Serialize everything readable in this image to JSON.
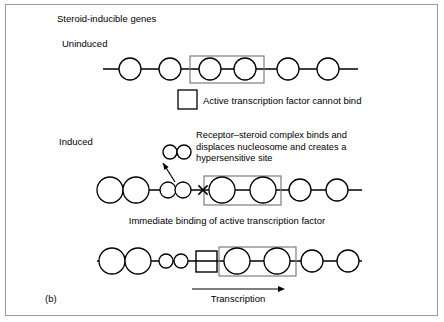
{
  "figure": {
    "label": "(b)",
    "title": "Steroid-inducible genes",
    "frame_color": "#9a9a9a",
    "ink_color": "#000000",
    "background_color": "#ffffff"
  },
  "panels": [
    {
      "id": "uninduced",
      "state_label": "Uninduced",
      "caption": "Active transcription factor cannot bind",
      "caption_has_box_swatch": true
    },
    {
      "id": "induced",
      "state_label": "Induced",
      "annotation_lines": [
        "Receptor–steroid complex binds and",
        "displaces nucleosome and creates a",
        "hypersensitive site"
      ],
      "hypersensitive_marker": "×"
    },
    {
      "id": "bound",
      "caption": "Immediate binding of active transcription factor",
      "arrow_label": "Transcription"
    }
  ],
  "legend": {
    "square_meaning": "Active transcription factor",
    "circle_meaning": "Nucleosome",
    "small_circle_meaning": "Receptor-steroid complex subunit"
  },
  "geometry": {
    "uninduced": {
      "dna_y": 69,
      "line_start_x": 103,
      "line_end_x": 358,
      "nucleosomes": [
        {
          "cx": 130,
          "r": 11
        },
        {
          "cx": 170,
          "r": 11
        },
        {
          "cx": 210,
          "r": 11
        },
        {
          "cx": 245,
          "r": 11
        },
        {
          "cx": 288,
          "r": 11
        },
        {
          "cx": 328,
          "r": 11
        }
      ],
      "gene_box": {
        "x": 190,
        "y": 56,
        "w": 74,
        "h": 27
      },
      "caption_box": {
        "x": 178,
        "y": 90,
        "w": 19,
        "h": 19
      },
      "caption_text_x": 203,
      "caption_text_y": 104
    },
    "induced": {
      "dna_y": 190,
      "line_start_x": 97,
      "line_end_x": 362,
      "nucleosomes": [
        {
          "cx": 110,
          "r": 13
        },
        {
          "cx": 136,
          "r": 13
        },
        {
          "cx": 168,
          "r": 8
        },
        {
          "cx": 183,
          "r": 8
        },
        {
          "cx": 222,
          "r": 13
        },
        {
          "cx": 263,
          "r": 13
        },
        {
          "cx": 300,
          "r": 11
        },
        {
          "cx": 337,
          "r": 11
        }
      ],
      "cross_x": 203,
      "gene_box": {
        "x": 204,
        "y": 176,
        "w": 77,
        "h": 29
      },
      "complex_circles": [
        {
          "cx": 170,
          "cy": 152,
          "r": 7
        },
        {
          "cx": 184,
          "cy": 152,
          "r": 7
        }
      ],
      "pointer": {
        "x1": 175,
        "y1": 182,
        "x2": 163,
        "y2": 163
      },
      "annotation_x": 196,
      "annotation_y": 138,
      "annotation_line_height": 11.5
    },
    "bound": {
      "dna_y": 261,
      "line_start_x": 97,
      "line_end_x": 362,
      "nucleosomes": [
        {
          "cx": 112,
          "r": 13
        },
        {
          "cx": 138,
          "r": 13
        },
        {
          "cx": 166,
          "r": 7
        },
        {
          "cx": 181,
          "r": 7
        },
        {
          "cx": 237,
          "r": 13
        },
        {
          "cx": 277,
          "r": 13
        },
        {
          "cx": 312,
          "r": 11
        },
        {
          "cx": 348,
          "r": 11
        }
      ],
      "factor_square": {
        "x": 196,
        "y": 251,
        "w": 21,
        "h": 21
      },
      "gene_box": {
        "x": 219,
        "y": 247,
        "w": 77,
        "h": 29
      },
      "arrow": {
        "x1": 192,
        "y1": 289,
        "x2": 285,
        "y2": 289
      },
      "arrow_label_x": 238,
      "arrow_label_y": 302,
      "caption_x": 227,
      "caption_y": 224
    },
    "title_x": 57,
    "title_y": 22,
    "uninduced_label_x": 62,
    "uninduced_label_y": 47,
    "induced_label_x": 59,
    "induced_label_y": 145,
    "figure_label_x": 45,
    "figure_label_y": 302
  }
}
